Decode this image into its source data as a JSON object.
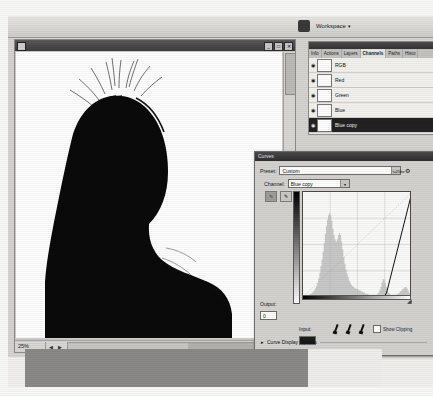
{
  "app": {
    "options_bar": {
      "logo_icon": "photoshop-logo-icon",
      "workspace_label": "Workspace",
      "workspace_caret": "▾"
    }
  },
  "document_window": {
    "system_icon": "document-system-icon",
    "title": "",
    "window_buttons": [
      "_",
      "□",
      "✕"
    ],
    "status": {
      "zoom": "25%",
      "nav_arrows": "◀ ▶"
    },
    "canvas_alt": "black silhouette of a head and shoulders on white background"
  },
  "channels_palette": {
    "tabs": [
      {
        "label": "Info",
        "active": false
      },
      {
        "label": "Actions",
        "active": false
      },
      {
        "label": "Layers",
        "active": false
      },
      {
        "label": "Channels",
        "active": true
      },
      {
        "label": "Paths",
        "active": false
      },
      {
        "label": "Histo",
        "active": false
      }
    ],
    "rows": [
      {
        "eye": "◉",
        "visible": true,
        "label": "RGB",
        "selected": false
      },
      {
        "eye": "◉",
        "visible": true,
        "label": "Red",
        "selected": false
      },
      {
        "eye": "◉",
        "visible": true,
        "label": "Green",
        "selected": false
      },
      {
        "eye": "◉",
        "visible": true,
        "label": "Blue",
        "selected": false
      },
      {
        "eye": "◉",
        "visible": true,
        "label": "Blue copy",
        "selected": true
      }
    ]
  },
  "curves_dialog": {
    "title": "Curves",
    "preset_label": "Preset:",
    "preset_value": "Custom",
    "preset_menu_icon": "preset-options-icon",
    "channel_label": "Channel:",
    "channel_value": "Blue copy",
    "tools": [
      {
        "name": "curve-point-tool",
        "glyph": "∿",
        "active": true
      },
      {
        "name": "pencil-draw-tool",
        "glyph": "✎",
        "active": false
      }
    ],
    "output_label": "Output:",
    "output_value": "0",
    "input_label": "Input:",
    "input_value": "",
    "eyedroppers": [
      {
        "name": "black-point-eyedropper"
      },
      {
        "name": "gray-point-eyedropper"
      },
      {
        "name": "white-point-eyedropper"
      }
    ],
    "show_clipping_label": "Show Clipping",
    "show_clipping_checked": false,
    "curve_display_options_label": "Curve Display Options",
    "disclosure_triangle": "▸",
    "resize_grip_icon": "resize-grip-icon"
  },
  "chart_data": {
    "type": "line",
    "xlabel": "Input",
    "ylabel": "Output",
    "xlim": [
      0,
      255
    ],
    "ylim": [
      0,
      255
    ],
    "grid": true,
    "grid_divisions": 4,
    "series": [
      {
        "name": "identity-baseline",
        "style": "diagonal-dashed",
        "x": [
          0,
          255
        ],
        "values": [
          0,
          255
        ]
      },
      {
        "name": "curve",
        "style": "solid",
        "x": [
          0,
          190,
          196,
          255
        ],
        "values": [
          0,
          0,
          12,
          255
        ]
      }
    ],
    "control_points": [
      {
        "input": 0,
        "output": 0
      },
      {
        "input": 196,
        "output": 0
      },
      {
        "input": 255,
        "output": 255
      }
    ],
    "histogram": {
      "name": "blue-copy-histogram",
      "bins": [
        1,
        1,
        1,
        1,
        2,
        2,
        3,
        3,
        4,
        5,
        6,
        8,
        10,
        13,
        17,
        22,
        28,
        34,
        41,
        49,
        57,
        64,
        70,
        74,
        76,
        74,
        69,
        62,
        56,
        52,
        50,
        52,
        56,
        58,
        56,
        50,
        43,
        36,
        30,
        25,
        21,
        18,
        15,
        13,
        11,
        10,
        9,
        8,
        8,
        7,
        7,
        6,
        6,
        5,
        5,
        4,
        4,
        3,
        3,
        3,
        2,
        2,
        2,
        2,
        2,
        2,
        2,
        2,
        3,
        4,
        6,
        9,
        13,
        16,
        16,
        13,
        9,
        6,
        4,
        3,
        2,
        2,
        2,
        2,
        2,
        2,
        3,
        3,
        4,
        5,
        6,
        7,
        8,
        9,
        9,
        8,
        6,
        4,
        2,
        1
      ],
      "max": 76
    }
  }
}
